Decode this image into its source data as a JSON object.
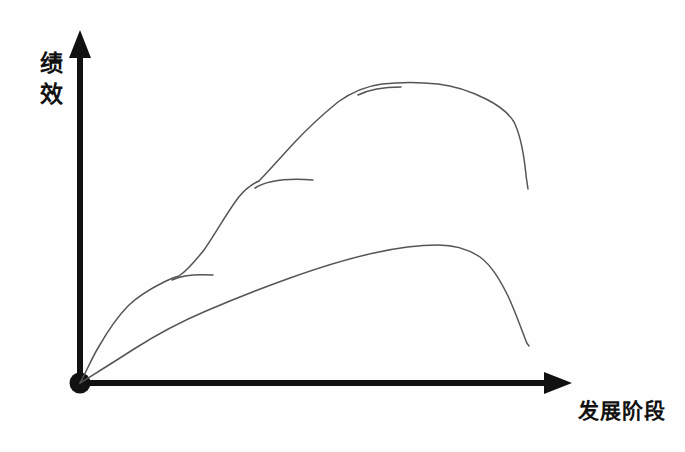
{
  "figure": {
    "title": "",
    "background_color": "#fefefe",
    "axis_color": "#111111",
    "curve_color": "#555555",
    "origin_marker": "filled-dot"
  },
  "axes": {
    "y": {
      "label": "绩效",
      "label_chars": [
        "绩",
        "效"
      ],
      "label_meaning": "Performance",
      "arrow": "up-arrow-icon",
      "origin_px": [
        80,
        383
      ],
      "tip_px": [
        80,
        33
      ]
    },
    "x": {
      "label": "发展阶段",
      "label_meaning": "Development Stage",
      "arrow": "right-arrow-icon",
      "origin_px": [
        80,
        383
      ],
      "tip_px": [
        572,
        383
      ]
    }
  },
  "chart_data": {
    "type": "line",
    "title": "",
    "xlabel": "发展阶段",
    "ylabel": "绩效",
    "xlim": [
      0,
      100
    ],
    "ylim": [
      0,
      100
    ],
    "grid": false,
    "legend": "none",
    "style": "hand-drawn",
    "note": "Two hand-drawn performance curves versus development stage; the upper curve is a stepped / staircase S-curve with three short plateau stubs, the lower curve is a single smooth S-curve.",
    "series": [
      {
        "name": "stepped-s-curve",
        "description": "Upper stepped S-curve rising in three stages, plateauing near the top, then dropping steeply",
        "points_px": [
          [
            80,
            383
          ],
          [
            96,
            351
          ],
          [
            112,
            326
          ],
          [
            128,
            305
          ],
          [
            146,
            290
          ],
          [
            163,
            281
          ],
          [
            178,
            276
          ],
          [
            196,
            264
          ],
          [
            212,
            243
          ],
          [
            228,
            220
          ],
          [
            244,
            198
          ],
          [
            258,
            182
          ],
          [
            276,
            164
          ],
          [
            292,
            146
          ],
          [
            308,
            128
          ],
          [
            324,
            112
          ],
          [
            342,
            99
          ],
          [
            360,
            90
          ],
          [
            380,
            85
          ],
          [
            402,
            83
          ],
          [
            424,
            83
          ],
          [
            446,
            86
          ],
          [
            468,
            92
          ],
          [
            488,
            100
          ],
          [
            506,
            110
          ],
          [
            518,
            128
          ],
          [
            524,
            150
          ],
          [
            526,
            170
          ],
          [
            528,
            188
          ]
        ],
        "x": [
          0,
          3,
          7,
          10,
          13,
          17,
          20,
          24,
          27,
          30,
          33,
          36,
          40,
          43,
          46,
          50,
          53,
          57,
          61,
          66,
          70,
          74,
          79,
          83,
          87,
          89,
          90,
          91,
          91
        ],
        "y": [
          0,
          9,
          16,
          22,
          27,
          29,
          31,
          34,
          40,
          47,
          53,
          57,
          63,
          68,
          73,
          77,
          81,
          84,
          85,
          86,
          86,
          85,
          83,
          81,
          78,
          73,
          67,
          61,
          56
        ]
      },
      {
        "name": "plateau-stub-1",
        "description": "Short horizontal branch at first plateau",
        "points_px": [
          [
            178,
            276
          ],
          [
            196,
            275
          ],
          [
            212,
            275
          ]
        ]
      },
      {
        "name": "plateau-stub-2",
        "description": "Short horizontal branch at second plateau",
        "points_px": [
          [
            262,
            183
          ],
          [
            286,
            180
          ],
          [
            312,
            180
          ]
        ]
      },
      {
        "name": "plateau-stub-3",
        "description": "Short horizontal branch at the top plateau",
        "points_px": [
          [
            365,
            92
          ],
          [
            382,
            88
          ],
          [
            400,
            87
          ]
        ]
      },
      {
        "name": "smooth-s-curve",
        "description": "Lower smooth S-curve rising gradually, peaking, then falling steeply",
        "points_px": [
          [
            80,
            383
          ],
          [
            104,
            366
          ],
          [
            128,
            351
          ],
          [
            152,
            337
          ],
          [
            176,
            325
          ],
          [
            200,
            313
          ],
          [
            226,
            302
          ],
          [
            252,
            292
          ],
          [
            278,
            282
          ],
          [
            304,
            273
          ],
          [
            330,
            265
          ],
          [
            356,
            258
          ],
          [
            382,
            252
          ],
          [
            408,
            248
          ],
          [
            430,
            246
          ],
          [
            448,
            246
          ],
          [
            466,
            249
          ],
          [
            482,
            256
          ],
          [
            496,
            268
          ],
          [
            508,
            286
          ],
          [
            518,
            308
          ],
          [
            524,
            328
          ],
          [
            528,
            345
          ]
        ],
        "x": [
          0,
          5,
          10,
          15,
          20,
          24,
          30,
          35,
          40,
          46,
          51,
          56,
          61,
          67,
          71,
          75,
          78,
          82,
          85,
          87,
          89,
          90,
          91
        ],
        "y": [
          0,
          5,
          9,
          13,
          17,
          20,
          23,
          26,
          29,
          31,
          34,
          36,
          37,
          38,
          39,
          39,
          38,
          36,
          33,
          28,
          21,
          16,
          11
        ]
      }
    ]
  }
}
